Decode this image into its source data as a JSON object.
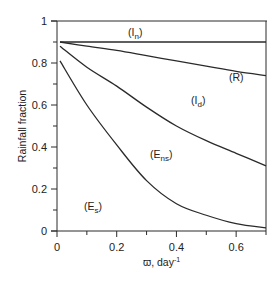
{
  "chart_data": {
    "type": "line",
    "title": "",
    "xlabel": "ϖ, day⁻¹",
    "ylabel": "Rainfall fraction",
    "xlim": [
      0,
      0.7
    ],
    "ylim": [
      0,
      1
    ],
    "xticks": [
      "0",
      "0.2",
      "0.4",
      "0.6"
    ],
    "xtick_values": [
      0,
      0.2,
      0.4,
      0.6
    ],
    "x_minor_ticks": [
      0.1,
      0.3,
      0.5
    ],
    "yticks": [
      "0",
      "0.2",
      "0.4",
      "0.6",
      "0.8",
      "1"
    ],
    "ytick_values": [
      0,
      0.2,
      0.4,
      0.6,
      0.8,
      1
    ],
    "y_minor_ticks": [
      0.1,
      0.3,
      0.5,
      0.7,
      0.9
    ],
    "grid": false,
    "legend": "none (regions labeled inline)",
    "x": [
      0.01,
      0.1,
      0.2,
      0.3,
      0.4,
      0.5,
      0.6,
      0.7
    ],
    "series": [
      {
        "name": "In/R boundary",
        "values": [
          0.9,
          0.9,
          0.9,
          0.9,
          0.9,
          0.9,
          0.9,
          0.9
        ]
      },
      {
        "name": "R/Id boundary",
        "values": [
          0.9,
          0.88,
          0.86,
          0.835,
          0.81,
          0.785,
          0.76,
          0.74
        ]
      },
      {
        "name": "Id/Ens boundary",
        "values": [
          0.88,
          0.78,
          0.69,
          0.59,
          0.5,
          0.43,
          0.37,
          0.31
        ]
      },
      {
        "name": "Ens/Es boundary",
        "values": [
          0.81,
          0.6,
          0.41,
          0.24,
          0.13,
          0.075,
          0.035,
          0.015
        ]
      }
    ],
    "region_labels": [
      {
        "text": "(I",
        "sub": "n",
        "x": 0.27,
        "y": 0.95
      },
      {
        "text": "(R",
        "sub": "",
        "x": 0.61,
        "y": 0.73
      },
      {
        "text": "(I",
        "sub": "d",
        "x": 0.48,
        "y": 0.62
      },
      {
        "text": "(E",
        "sub": "ns",
        "x": 0.35,
        "y": 0.36
      },
      {
        "text": "(E",
        "sub": "s",
        "x": 0.13,
        "y": 0.11
      }
    ],
    "line_color": "#2a2a2a"
  },
  "labels": {
    "ylabel": "Rainfall fraction",
    "xlabel_main": "ϖ, day",
    "xlabel_sup": "-1",
    "In": "(I",
    "In_sub": "n",
    "R": "(R)",
    "Id": "(I",
    "Id_sub": "d",
    "Ens": "(E",
    "Ens_sub": "ns",
    "Es": "(E",
    "Es_sub": "s",
    "close_paren": ")"
  }
}
